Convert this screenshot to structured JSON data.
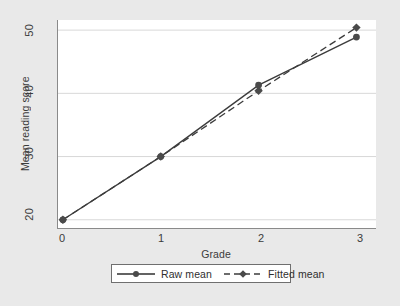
{
  "chart_data": {
    "type": "line",
    "title": "",
    "subtitle": "",
    "xlabel": "Grade",
    "ylabel": "Mean reading score",
    "x": [
      0,
      1,
      2,
      3
    ],
    "xtick_labels": [
      "0",
      "1",
      "2",
      "3"
    ],
    "xlim": [
      -0.05,
      3.2
    ],
    "ytick_labels": [
      "20",
      "30",
      "40",
      "50"
    ],
    "yticks": [
      20,
      30,
      40,
      50
    ],
    "ylim": [
      18.7,
      51.6
    ],
    "grid": "horizontal",
    "legend_position": "bottom-center",
    "series": [
      {
        "name": "Raw mean",
        "values": [
          20.0,
          30.0,
          41.3,
          48.9
        ],
        "linestyle": "solid",
        "marker": "circle",
        "color": "#3c3c3c"
      },
      {
        "name": "Fitted mean",
        "values": [
          20.0,
          30.0,
          40.4,
          50.4
        ],
        "linestyle": "dashed",
        "marker": "diamond",
        "color": "#3c3c3c"
      }
    ]
  },
  "legend": {
    "entries": [
      {
        "label": "Raw mean"
      },
      {
        "label": "Fitted mean"
      }
    ]
  },
  "colors": {
    "figure_background": "#e9e9e9",
    "plot_background": "#ffffff",
    "axis": "#8a8a8a",
    "gridline": "#d8d8d8",
    "series": "#3c3c3c",
    "text": "#3b3b3b"
  }
}
